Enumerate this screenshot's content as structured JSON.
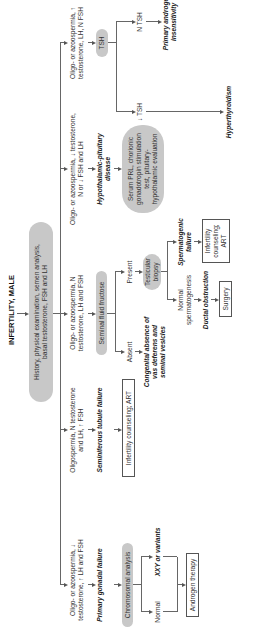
{
  "title": "INFERTILITY, MALE",
  "start": "History, physical examination, semen analysis, basal testosterone, FSH and LH",
  "branches": [
    {
      "finding": "Oligo- or azoospermia, ↓ testosterone, ↑ LH and FSH",
      "diagnosis": "Primary gonadal failure",
      "test": "Chromosomal analysis",
      "outcomes": [
        {
          "label": "Normal"
        },
        {
          "label": "XXY or variants"
        }
      ],
      "treatment": "Androgen therapy"
    },
    {
      "finding": "Oligospermia, N testosterone and LH, ↑ FSH",
      "diagnosis": "Seminiferous tubule failure",
      "treatment": "Infertility counseling; ART"
    },
    {
      "finding": "Oligo- or azoospermia, N testosterone, LH and FSH",
      "test": "Seminal fluid fructose",
      "outcomes": [
        {
          "label": "Absent",
          "diagnosis": "Congenital absence of vas deferens and seminal vesicles"
        },
        {
          "label": "Present",
          "test": "Testicular biopsy",
          "sub": [
            {
              "label": "Normal spermatogenesis",
              "diagnosis": "Ductal obstruction",
              "treatment": "Surgery"
            },
            {
              "label": "Spermatogenic failure",
              "treatment": "Infertility counseling; ART"
            }
          ]
        }
      ]
    },
    {
      "finding": "Oligo- or azoospermia, ↓ testosterone, N or ↓ FSH and LH",
      "diagnosis": "Hypothalamic-pituitary disease",
      "test": "Serum PRL, chorionic gonadotropin stimulation test, pituitary-hypothalamic evaluation"
    },
    {
      "finding": "Oligo- or azoospermia, ↑ testosterone, LH, N FSH",
      "test": "TSH",
      "outcomes": [
        {
          "label": "↓ TSH",
          "diagnosis": "Hyperthyroidism"
        },
        {
          "label": "N TSH",
          "diagnosis": "Primary androgen insensitivity"
        }
      ]
    }
  ]
}
